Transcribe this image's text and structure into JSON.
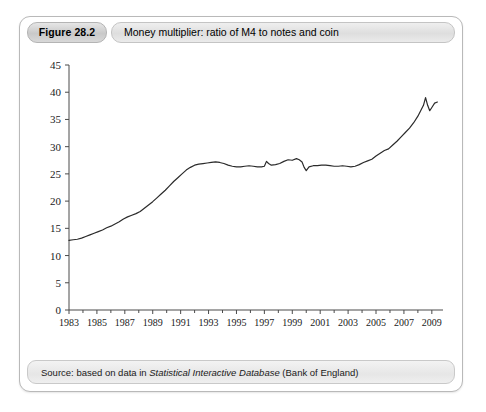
{
  "figure": {
    "badge_label": "Figure 28.2",
    "title": "Money multiplier: ratio of M4 to notes and coin",
    "source_prefix": "Source: based on data in ",
    "source_italic": "Statistical Interactive Database",
    "source_suffix": " (Bank of England)"
  },
  "chart_data": {
    "type": "line",
    "title": "Money multiplier: ratio of M4 to notes and coin",
    "xlabel": "",
    "ylabel": "",
    "xlim": [
      1983,
      2009.8
    ],
    "ylim": [
      0,
      45
    ],
    "grid": false,
    "legend": null,
    "line_color": "#2b2b2b",
    "y_ticks": [
      0,
      5,
      10,
      15,
      20,
      25,
      30,
      35,
      40,
      45
    ],
    "x_ticks": [
      1983,
      1985,
      1987,
      1989,
      1991,
      1993,
      1995,
      1997,
      1999,
      2001,
      2003,
      2005,
      2007,
      2009
    ],
    "x_minor_ticks": [
      1984,
      1986,
      1988,
      1990,
      1992,
      1994,
      1996,
      1998,
      2000,
      2002,
      2004,
      2006,
      2008
    ],
    "series": [
      {
        "name": "Money multiplier (M4 / notes and coin)",
        "x": [
          1983.0,
          1983.3,
          1983.6,
          1983.9,
          1984.2,
          1984.5,
          1984.8,
          1985.1,
          1985.4,
          1985.7,
          1986.0,
          1986.3,
          1986.6,
          1986.9,
          1987.2,
          1987.5,
          1987.8,
          1988.1,
          1988.4,
          1988.7,
          1989.0,
          1989.3,
          1989.6,
          1989.9,
          1990.2,
          1990.5,
          1990.8,
          1991.1,
          1991.4,
          1991.7,
          1992.0,
          1992.3,
          1992.6,
          1992.9,
          1993.2,
          1993.5,
          1993.8,
          1994.1,
          1994.4,
          1994.7,
          1995.0,
          1995.3,
          1995.6,
          1995.9,
          1996.2,
          1996.5,
          1996.8,
          1997.0,
          1997.15,
          1997.3,
          1997.5,
          1997.8,
          1998.1,
          1998.4,
          1998.7,
          1999.0,
          1999.3,
          1999.5,
          1999.7,
          1999.85,
          2000.0,
          2000.2,
          2000.5,
          2000.8,
          2001.1,
          2001.4,
          2001.7,
          2002.0,
          2002.3,
          2002.6,
          2002.9,
          2003.2,
          2003.5,
          2003.8,
          2004.1,
          2004.4,
          2004.7,
          2005.0,
          2005.3,
          2005.6,
          2005.9,
          2006.2,
          2006.5,
          2006.8,
          2007.1,
          2007.4,
          2007.7,
          2008.0,
          2008.2,
          2008.4,
          2008.55,
          2008.7,
          2008.85,
          2009.0,
          2009.2,
          2009.4
        ],
        "y": [
          12.8,
          12.9,
          13.0,
          13.2,
          13.5,
          13.8,
          14.1,
          14.4,
          14.7,
          15.1,
          15.4,
          15.8,
          16.2,
          16.7,
          17.1,
          17.4,
          17.7,
          18.1,
          18.7,
          19.3,
          19.9,
          20.6,
          21.3,
          22.0,
          22.8,
          23.6,
          24.3,
          25.0,
          25.7,
          26.2,
          26.6,
          26.8,
          26.9,
          27.0,
          27.1,
          27.2,
          27.1,
          26.9,
          26.6,
          26.4,
          26.3,
          26.3,
          26.4,
          26.5,
          26.4,
          26.3,
          26.3,
          26.4,
          27.3,
          26.9,
          26.6,
          26.7,
          26.9,
          27.3,
          27.6,
          27.5,
          27.8,
          27.6,
          27.2,
          26.2,
          25.6,
          26.3,
          26.5,
          26.5,
          26.6,
          26.6,
          26.5,
          26.4,
          26.4,
          26.5,
          26.4,
          26.3,
          26.4,
          26.7,
          27.1,
          27.4,
          27.7,
          28.3,
          28.8,
          29.3,
          29.6,
          30.3,
          31.0,
          31.8,
          32.6,
          33.4,
          34.4,
          35.6,
          36.6,
          37.6,
          39.0,
          37.6,
          36.6,
          37.2,
          38.0,
          38.2
        ]
      }
    ]
  }
}
